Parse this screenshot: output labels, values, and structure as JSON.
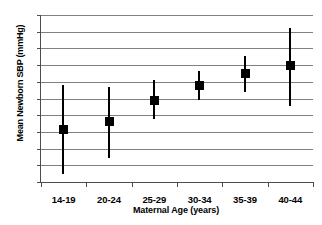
{
  "chart_data": {
    "type": "scatter",
    "title": "",
    "xlabel": "Maternal Age (years)",
    "ylabel": "Mean Newborn SBP (mmHg)",
    "categories": [
      "14-19",
      "20-24",
      "25-29",
      "30-34",
      "35-39",
      "40-44"
    ],
    "values": [
      70.15,
      70.6,
      71.9,
      72.75,
      73.5,
      73.95
    ],
    "error_low": [
      67.5,
      68.45,
      70.75,
      71.9,
      72.4,
      71.55
    ],
    "error_high": [
      72.8,
      72.7,
      73.1,
      73.65,
      74.55,
      76.25
    ],
    "ylim": [
      67,
      77
    ],
    "y_ticks": [
      67,
      68,
      69,
      70,
      71,
      72,
      73,
      74,
      75,
      76,
      77
    ],
    "y_tick_labels": [
      "67",
      "68",
      "69",
      "70",
      "71",
      "72",
      "73",
      "74",
      "75",
      "76",
      "77"
    ],
    "grid": true,
    "legend": "none",
    "series": [
      {
        "name": "Mean Newborn SBP with 95% CI",
        "values": [
          70.15,
          70.6,
          71.9,
          72.75,
          73.5,
          73.95
        ]
      }
    ],
    "marker": "filled-square",
    "marker_color": "#000000",
    "whisker_color": "#000000",
    "gridline_color": "#808080",
    "axis_color": "#4d4d4d",
    "background_color": "#ffffff"
  }
}
